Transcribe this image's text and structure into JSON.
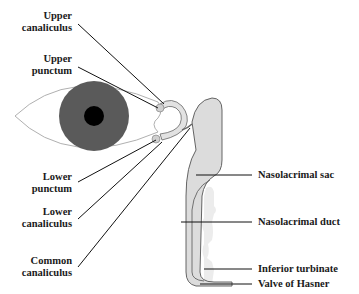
{
  "diagram": {
    "type": "anatomical",
    "colors": {
      "iris": "#5a5a5a",
      "pupil": "#000000",
      "eye_outline": "#b0b0b0",
      "duct_fill": "#dcdcdc",
      "duct_outline": "#555555",
      "turbinate_fill": "#ececec",
      "leader_line": "#111111",
      "label_text": "#1a1a1a"
    },
    "labels_left": [
      {
        "line1": "Upper",
        "line2": "canaliculus"
      },
      {
        "line1": "Upper",
        "line2": "punctum"
      },
      {
        "line1": "Lower",
        "line2": "punctum"
      },
      {
        "line1": "Lower",
        "line2": "canaliculus"
      },
      {
        "line1": "Common",
        "line2": "canaliculus"
      }
    ],
    "labels_right": [
      {
        "text": "Nasolacrimal sac"
      },
      {
        "text": "Nasolacrimal duct"
      },
      {
        "text": "Inferior turbinate"
      },
      {
        "text": "Valve of Hasner"
      }
    ]
  }
}
